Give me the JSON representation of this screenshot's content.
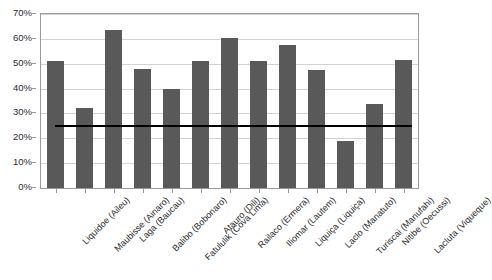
{
  "chart_data": {
    "type": "bar",
    "title": "",
    "subtitle": "",
    "xlabel": "",
    "ylabel": "",
    "ylim": [
      0,
      70
    ],
    "ytick_values": [
      0,
      10,
      20,
      30,
      40,
      50,
      60,
      70
    ],
    "ytick_labels": [
      "0%",
      "10%",
      "20%",
      "30%",
      "40%",
      "50%",
      "60%",
      "70%"
    ],
    "grid": true,
    "legend": "none",
    "value_format": "percent",
    "categories": [
      "Liquidoe (Aileu)",
      "Maubisse (Ainaro)",
      "Laga (Baucau)",
      "Balibo (Bobonaro)",
      "Fatululik (Cova Lima)",
      "Atauro (Dili)",
      "Railaco (Ermera)",
      "Iliomar (Lautem)",
      "Liquiça (Liquiça)",
      "Laclo (Manatuto)",
      "Turiscai (Manufahi)",
      "Nitibe (Oecussi)",
      "Lacluta (Viqueque)"
    ],
    "values": [
      51,
      32,
      63.5,
      48,
      40,
      51,
      60.5,
      51,
      57.5,
      47.5,
      19,
      34,
      51.5
    ],
    "bar_color": "#595959",
    "reference_line": {
      "value": 25,
      "color": "#000000",
      "label": ""
    }
  }
}
